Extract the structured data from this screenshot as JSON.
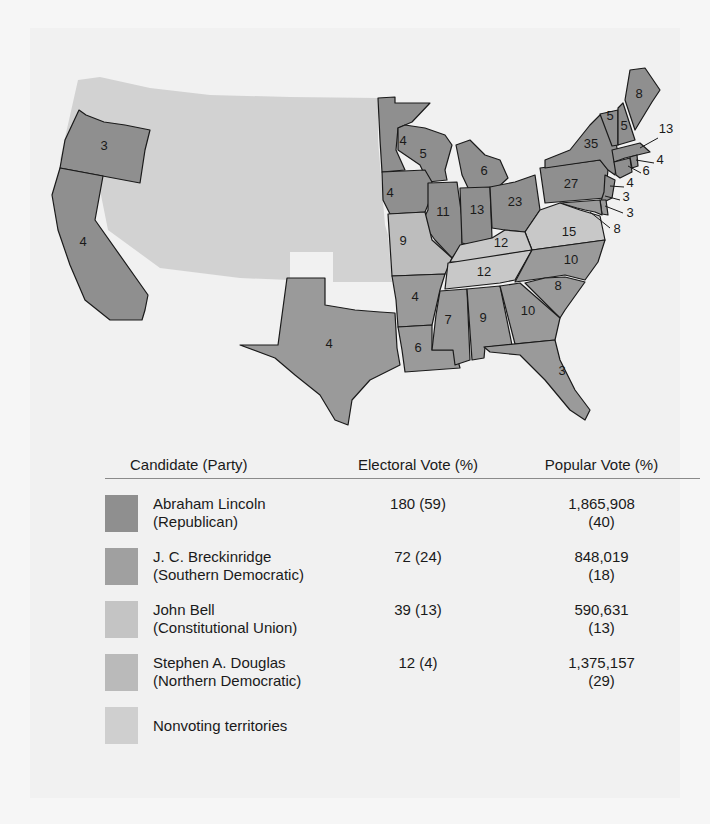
{
  "map": {
    "title": "1860 Presidential Election Electoral Map",
    "state_labels": [
      {
        "state": "Oregon",
        "votes": "3",
        "winner": "lincoln",
        "x": 104,
        "y": 150
      },
      {
        "state": "California",
        "votes": "4",
        "winner": "lincoln",
        "x": 83,
        "y": 246
      },
      {
        "state": "Minnesota",
        "votes": "4",
        "winner": "lincoln",
        "x": 403,
        "y": 145
      },
      {
        "state": "Wisconsin",
        "votes": "5",
        "winner": "lincoln",
        "x": 423,
        "y": 158
      },
      {
        "state": "Michigan",
        "votes": "6",
        "winner": "lincoln",
        "x": 484,
        "y": 175
      },
      {
        "state": "Iowa",
        "votes": "4",
        "winner": "lincoln",
        "x": 390,
        "y": 197
      },
      {
        "state": "Illinois",
        "votes": "11",
        "winner": "lincoln",
        "x": 443,
        "y": 216
      },
      {
        "state": "Indiana",
        "votes": "13",
        "winner": "lincoln",
        "x": 477,
        "y": 214
      },
      {
        "state": "Ohio",
        "votes": "23",
        "winner": "lincoln",
        "x": 515,
        "y": 206
      },
      {
        "state": "Pennsylvania",
        "votes": "27",
        "winner": "lincoln",
        "x": 571,
        "y": 188
      },
      {
        "state": "New York",
        "votes": "35",
        "winner": "lincoln",
        "x": 591,
        "y": 148
      },
      {
        "state": "Vermont",
        "votes": "5",
        "winner": "lincoln",
        "x": 610,
        "y": 120
      },
      {
        "state": "New Hampshire",
        "votes": "5",
        "winner": "lincoln",
        "x": 624,
        "y": 130
      },
      {
        "state": "Maine",
        "votes": "8",
        "winner": "lincoln",
        "x": 639,
        "y": 98
      },
      {
        "state": "Massachusetts",
        "votes": "13",
        "winner": "lincoln",
        "x": 666,
        "y": 133
      },
      {
        "state": "Rhode Island",
        "votes": "4",
        "winner": "lincoln",
        "x": 660,
        "y": 164
      },
      {
        "state": "Connecticut",
        "votes": "6",
        "winner": "lincoln",
        "x": 646,
        "y": 175
      },
      {
        "state": "New Jersey",
        "votes": "4",
        "winner": "lincoln",
        "x": 630,
        "y": 187
      },
      {
        "state": "Delaware",
        "votes": "3",
        "winner": "breckinridge",
        "x": 626,
        "y": 201
      },
      {
        "state": "Maryland",
        "votes": "3",
        "winner": "breckinridge",
        "x": 630,
        "y": 217
      },
      {
        "state": "Maryland/DC",
        "votes": "8",
        "winner": "breckinridge",
        "x": 617,
        "y": 233
      },
      {
        "state": "Virginia",
        "votes": "15",
        "winner": "bell",
        "x": 569,
        "y": 236
      },
      {
        "state": "Missouri",
        "votes": "9",
        "winner": "douglas",
        "x": 403,
        "y": 245
      },
      {
        "state": "Kentucky",
        "votes": "12",
        "winner": "bell",
        "x": 501,
        "y": 247
      },
      {
        "state": "Tennessee",
        "votes": "12",
        "winner": "bell",
        "x": 484,
        "y": 276
      },
      {
        "state": "North Carolina",
        "votes": "10",
        "winner": "breckinridge",
        "x": 571,
        "y": 264
      },
      {
        "state": "South Carolina",
        "votes": "8",
        "winner": "breckinridge",
        "x": 558,
        "y": 290
      },
      {
        "state": "Arkansas",
        "votes": "4",
        "winner": "breckinridge",
        "x": 415,
        "y": 301
      },
      {
        "state": "Mississippi",
        "votes": "7",
        "winner": "breckinridge",
        "x": 448,
        "y": 324
      },
      {
        "state": "Alabama",
        "votes": "9",
        "winner": "breckinridge",
        "x": 483,
        "y": 322
      },
      {
        "state": "Georgia",
        "votes": "10",
        "winner": "breckinridge",
        "x": 528,
        "y": 315
      },
      {
        "state": "Louisiana",
        "votes": "6",
        "winner": "breckinridge",
        "x": 418,
        "y": 352
      },
      {
        "state": "Texas",
        "votes": "4",
        "winner": "breckinridge",
        "x": 329,
        "y": 348
      },
      {
        "state": "Florida",
        "votes": "3",
        "winner": "breckinridge",
        "x": 562,
        "y": 375
      }
    ]
  },
  "legend": {
    "headers": {
      "candidate": "Candidate (Party)",
      "electoral": "Electoral Vote (%)",
      "popular": "Popular Vote (%)"
    },
    "rows": [
      {
        "key": "lincoln",
        "name": "Abraham Lincoln",
        "party": "(Republican)",
        "electoral": "180 (59)",
        "popular": "1,865,908",
        "popular_pct": "(40)",
        "color": "#8f8f8f"
      },
      {
        "key": "breckinridge",
        "name": "J. C. Breckinridge",
        "party": "(Southern Democratic)",
        "electoral": "72 (24)",
        "popular": "848,019",
        "popular_pct": "(18)",
        "color": "#a0a0a0"
      },
      {
        "key": "bell",
        "name": "John Bell",
        "party": "(Constitutional Union)",
        "electoral": "39 (13)",
        "popular": "590,631",
        "popular_pct": "(13)",
        "color": "#c4c4c4"
      },
      {
        "key": "douglas",
        "name": "Stephen A. Douglas",
        "party": "(Northern Democratic)",
        "electoral": "12 (4)",
        "popular": "1,375,157",
        "popular_pct": "(29)",
        "color": "#bababa"
      },
      {
        "key": "territories",
        "name": "Nonvoting territories",
        "party": "",
        "electoral": "",
        "popular": "",
        "popular_pct": "",
        "color": "#cfcfcf"
      }
    ]
  }
}
